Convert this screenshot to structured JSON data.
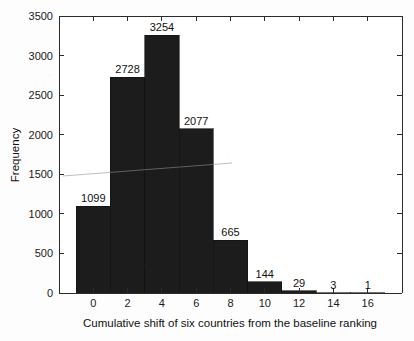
{
  "chart_data": {
    "type": "bar",
    "title": "",
    "subtitle": "",
    "xlabel": "Cumulative shift of six countries from the baseline ranking",
    "ylabel": "Frequency",
    "xlim": [
      -2,
      18
    ],
    "ylim": [
      0,
      3500
    ],
    "grid": false,
    "legend": null,
    "bin_width": 2,
    "bin_edges": [
      -1,
      1,
      3,
      5,
      7,
      9,
      11,
      13,
      15,
      17
    ],
    "bin_centers": [
      0,
      2,
      4,
      6,
      8,
      10,
      12,
      14,
      16
    ],
    "categories": [
      "0",
      "2",
      "4",
      "6",
      "8",
      "10",
      "12",
      "14",
      "16"
    ],
    "values": [
      1099,
      2728,
      3254,
      2077,
      665,
      144,
      29,
      3,
      1
    ],
    "data_labels": [
      "1099",
      "2728",
      "3254",
      "2077",
      "665",
      "144",
      "29",
      "3",
      "1"
    ],
    "xticks": [
      0,
      2,
      4,
      6,
      8,
      10,
      12,
      14,
      16
    ],
    "xtick_labels": [
      "0",
      "2",
      "4",
      "6",
      "8",
      "10",
      "12",
      "14",
      "16"
    ],
    "yticks": [
      0,
      500,
      1000,
      1500,
      2000,
      2500,
      3000,
      3500
    ],
    "ytick_labels": [
      "0",
      "500",
      "1000",
      "1500",
      "2000",
      "2500",
      "3000",
      "3500"
    ],
    "bar_color": "#1c1c1c",
    "axis_color": "#2b2b2b",
    "background_color": "#fdfdfd"
  }
}
